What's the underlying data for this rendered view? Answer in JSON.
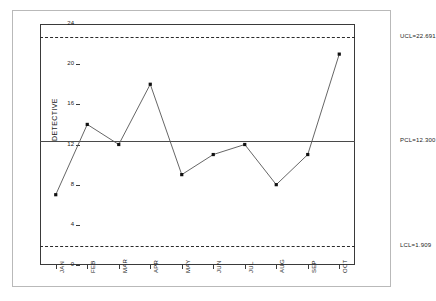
{
  "chart_data": {
    "type": "line",
    "title": "",
    "xlabel": "",
    "ylabel": "DETECTIVE",
    "categories": [
      "JAN",
      "FEB",
      "MAR",
      "APR",
      "MAY",
      "JUN",
      "JUL",
      "AUG",
      "SEP",
      "OCT"
    ],
    "values": [
      7,
      14,
      12,
      18,
      9,
      11,
      12,
      8,
      11,
      21
    ],
    "series": [
      {
        "name": "DETECTIVE",
        "values": [
          7,
          14,
          12,
          18,
          9,
          11,
          12,
          8,
          11,
          21
        ]
      }
    ],
    "ylim": [
      0,
      24
    ],
    "yticks": [
      0,
      4,
      8,
      12,
      16,
      20,
      24
    ],
    "ytick_labels": [
      "0",
      "4",
      "8",
      "12",
      "16",
      "20",
      "24"
    ],
    "grid": false,
    "legend": "none",
    "marker": "filled-square",
    "line_color": "#555555",
    "marker_color": "#111111",
    "control_lines": [
      {
        "id": "ucl",
        "label": "UCL=22.691",
        "value": 22.691,
        "style": "dashed"
      },
      {
        "id": "pcl",
        "label": "PCL=12.300",
        "value": 12.3,
        "style": "solid"
      },
      {
        "id": "lcl",
        "label": "LCL=1.909",
        "value": 1.909,
        "style": "dashed"
      }
    ]
  }
}
